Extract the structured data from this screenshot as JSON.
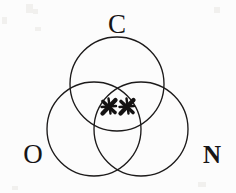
{
  "figure": {
    "kind": "three-circle-venn-diagram",
    "background_color": "#fcfcfc",
    "ink_color": "#1c1a1a",
    "width": 236,
    "height": 193
  },
  "circles": [
    {
      "id": "circle-c",
      "label": "C",
      "label_name": "carbon",
      "cx": 117,
      "cy": 84,
      "r": 47,
      "stroke": "#1c1a1a",
      "label_x": 117,
      "label_y": 27
    },
    {
      "id": "circle-o",
      "label": "O",
      "label_name": "oxygen",
      "cx": 94,
      "cy": 129,
      "r": 47,
      "stroke": "#1c1a1a",
      "label_x": 33,
      "label_y": 157
    },
    {
      "id": "circle-n",
      "label": "N",
      "label_name": "nitrogen",
      "cx": 141,
      "cy": 129,
      "r": 47,
      "stroke": "#1c1a1a",
      "label_x": 212,
      "label_y": 157
    }
  ],
  "electron_marks": [
    {
      "id": "electron-mark-left",
      "glyph": "x",
      "cx": 109,
      "cy": 107,
      "size": 11,
      "color": "#141212"
    },
    {
      "id": "electron-mark-right",
      "glyph": "x",
      "cx": 127,
      "cy": 107,
      "size": 11,
      "color": "#141212"
    }
  ],
  "labels": {
    "carbon": "C",
    "oxygen": "O",
    "nitrogen": "N"
  }
}
